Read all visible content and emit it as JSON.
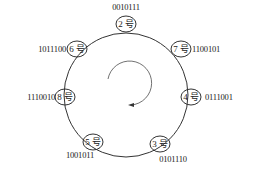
{
  "diagram": {
    "type": "ring",
    "direction": "clockwise",
    "nodes": [
      {
        "id": "2",
        "label": "2 号",
        "code": "0010111",
        "code_side": "top"
      },
      {
        "id": "7",
        "label": "7 号",
        "code": "1100101",
        "code_side": "right"
      },
      {
        "id": "4",
        "label": "4 号",
        "code": "0111001",
        "code_side": "right"
      },
      {
        "id": "3",
        "label": "3 号",
        "code": "0101110",
        "code_side": "bottom"
      },
      {
        "id": "5",
        "label": "5 号",
        "code": "1001011",
        "code_side": "bottom"
      },
      {
        "id": "8",
        "label": "8 号",
        "code": "1110010",
        "code_side": "left"
      },
      {
        "id": "6",
        "label": "6 号",
        "code": "1011100",
        "code_side": "left"
      }
    ]
  },
  "colors": {
    "stroke": "#333333",
    "text": "#222222",
    "background": "#ffffff"
  }
}
